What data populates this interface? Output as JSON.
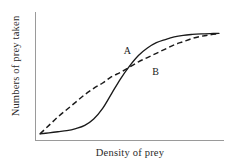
{
  "chart_data": {
    "type": "line",
    "title": "",
    "subtitle": "",
    "xlabel": "Density of prey",
    "ylabel": "Numbers of prey taken",
    "xlim": [
      0,
      1
    ],
    "ylim": [
      0,
      1
    ],
    "grid": false,
    "xticks": [],
    "yticks": [],
    "xticklabels": [],
    "yticklabels": [],
    "legend_position": "inline-annotations",
    "annotations": [
      {
        "text": "A",
        "x": 0.49,
        "y": 0.8,
        "refers_to": "Curve A"
      },
      {
        "text": "B",
        "x": 0.65,
        "y": 0.6,
        "refers_to": "Curve B"
      }
    ],
    "series": [
      {
        "name": "A",
        "label": "A",
        "style": "solid",
        "color": "#1a1a1a",
        "description": "Sigmoid (type III) functional response",
        "x": [
          0.0,
          0.05,
          0.1,
          0.15,
          0.2,
          0.25,
          0.3,
          0.35,
          0.4,
          0.45,
          0.5,
          0.55,
          0.6,
          0.65,
          0.7,
          0.75,
          0.8,
          0.85,
          0.9,
          0.95,
          1.0
        ],
        "y": [
          0.02,
          0.03,
          0.04,
          0.05,
          0.07,
          0.1,
          0.16,
          0.26,
          0.4,
          0.54,
          0.66,
          0.76,
          0.83,
          0.88,
          0.91,
          0.935,
          0.95,
          0.958,
          0.963,
          0.966,
          0.968
        ]
      },
      {
        "name": "B",
        "label": "B",
        "style": "dashed",
        "color": "#1a1a1a",
        "description": "Hyperbolic (type II) functional response",
        "x": [
          0.0,
          0.05,
          0.1,
          0.15,
          0.2,
          0.25,
          0.3,
          0.35,
          0.4,
          0.45,
          0.5,
          0.55,
          0.6,
          0.65,
          0.7,
          0.75,
          0.8,
          0.85,
          0.9,
          0.95,
          1.0
        ],
        "y": [
          0.02,
          0.1,
          0.18,
          0.25,
          0.32,
          0.39,
          0.45,
          0.5,
          0.56,
          0.6,
          0.65,
          0.7,
          0.74,
          0.78,
          0.82,
          0.86,
          0.89,
          0.92,
          0.94,
          0.955,
          0.965
        ]
      }
    ],
    "crossing_point": {
      "x": 0.47,
      "y": 0.58
    },
    "colors": {
      "axis": "#9a9a9a",
      "curve": "#1a1a1a",
      "background": "#ffffff",
      "text": "#2a2a2a"
    }
  }
}
